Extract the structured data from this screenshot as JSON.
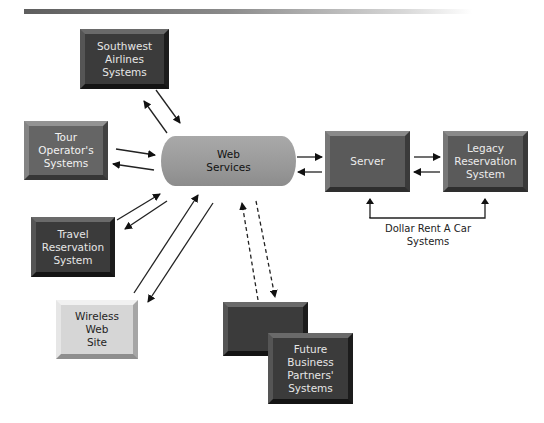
{
  "diagram": {
    "type": "system-architecture",
    "hub": {
      "id": "web-services",
      "label": "Web\nServices",
      "shape": "cylinder",
      "color": "#9c9c9c"
    },
    "nodes": [
      {
        "id": "southwest",
        "label": "Southwest\nAirlines\nSystems",
        "style": "dark"
      },
      {
        "id": "tour-operators",
        "label": "Tour\nOperator's\nSystems",
        "style": "midgrey"
      },
      {
        "id": "travel-reservation",
        "label": "Travel\nReservation\nSystem",
        "style": "dark"
      },
      {
        "id": "wireless",
        "label": "Wireless\nWeb\nSite",
        "style": "light"
      },
      {
        "id": "future-back",
        "label": "",
        "style": "dark"
      },
      {
        "id": "future-front",
        "label": "Future\nBusiness\nPartners'\nSystems",
        "style": "dark"
      },
      {
        "id": "server",
        "label": "Server",
        "style": "mid"
      },
      {
        "id": "legacy",
        "label": "Legacy\nReservation\nSystem",
        "style": "mid"
      }
    ],
    "group_label": "Dollar Rent A Car\nSystems",
    "edges": [
      {
        "from": "southwest",
        "to": "web-services",
        "bidirectional": true,
        "style": "solid"
      },
      {
        "from": "tour-operators",
        "to": "web-services",
        "bidirectional": true,
        "style": "solid"
      },
      {
        "from": "travel-reservation",
        "to": "web-services",
        "bidirectional": true,
        "style": "solid"
      },
      {
        "from": "wireless",
        "to": "web-services",
        "bidirectional": true,
        "style": "solid"
      },
      {
        "from": "future-back",
        "to": "web-services",
        "bidirectional": true,
        "style": "dashed"
      },
      {
        "from": "web-services",
        "to": "server",
        "bidirectional": true,
        "style": "solid"
      },
      {
        "from": "server",
        "to": "legacy",
        "bidirectional": true,
        "style": "solid"
      }
    ]
  }
}
